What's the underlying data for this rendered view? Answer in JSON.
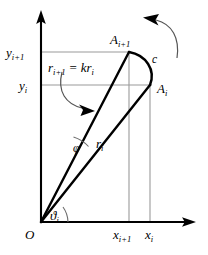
{
  "figure": {
    "background_color": "#ffffff",
    "ink_color": "#000000",
    "grid_color": "#9a9a9a",
    "axes": {
      "origin_label": "O",
      "y_axis_name": "y-axis",
      "x_axis_name": "x-axis",
      "y_ticks": [
        {
          "label_main": "y",
          "label_sub": "i+1",
          "value_name": "y_{i+1}"
        },
        {
          "label_main": "y",
          "label_sub": "i",
          "value_name": "y_i"
        }
      ],
      "x_ticks": [
        {
          "label_main": "x",
          "label_sub": "i+1",
          "value_name": "x_{i+1}"
        },
        {
          "label_main": "x",
          "label_sub": "i",
          "value_name": "x_i"
        }
      ]
    },
    "points": [
      {
        "name": "A_{i+1}",
        "label_main": "A",
        "label_sub": "i+1"
      },
      {
        "name": "A_i",
        "label_main": "A",
        "label_sub": "i"
      }
    ],
    "segments": [
      {
        "name": "r_i",
        "label_main": "r",
        "label_sub": "i"
      },
      {
        "name": "r_{i+1}",
        "label_main": "r",
        "label_sub": "i+1"
      }
    ],
    "arc_label": "c",
    "angles": [
      {
        "name": "phi",
        "glyph": "φ",
        "description": "angle between r_i and r_{i+1}"
      },
      {
        "name": "theta_i",
        "glyph": "ϑ",
        "sub": "i",
        "description": "polar angle of A_i from x-axis"
      }
    ],
    "equation": {
      "lhs_main": "r",
      "lhs_sub": "i+1",
      "operator": "=",
      "rhs_coefficient": "k",
      "rhs_main": "r",
      "rhs_sub": "i",
      "full_text": "r_{i+1} = k r_i"
    },
    "annotations": [
      {
        "name": "rotation-arrow",
        "description": "curved arrow indicating rotation direction"
      },
      {
        "name": "equation-pointer-arrow",
        "description": "curved arrow from equation to r_{i+1} segment"
      }
    ]
  }
}
